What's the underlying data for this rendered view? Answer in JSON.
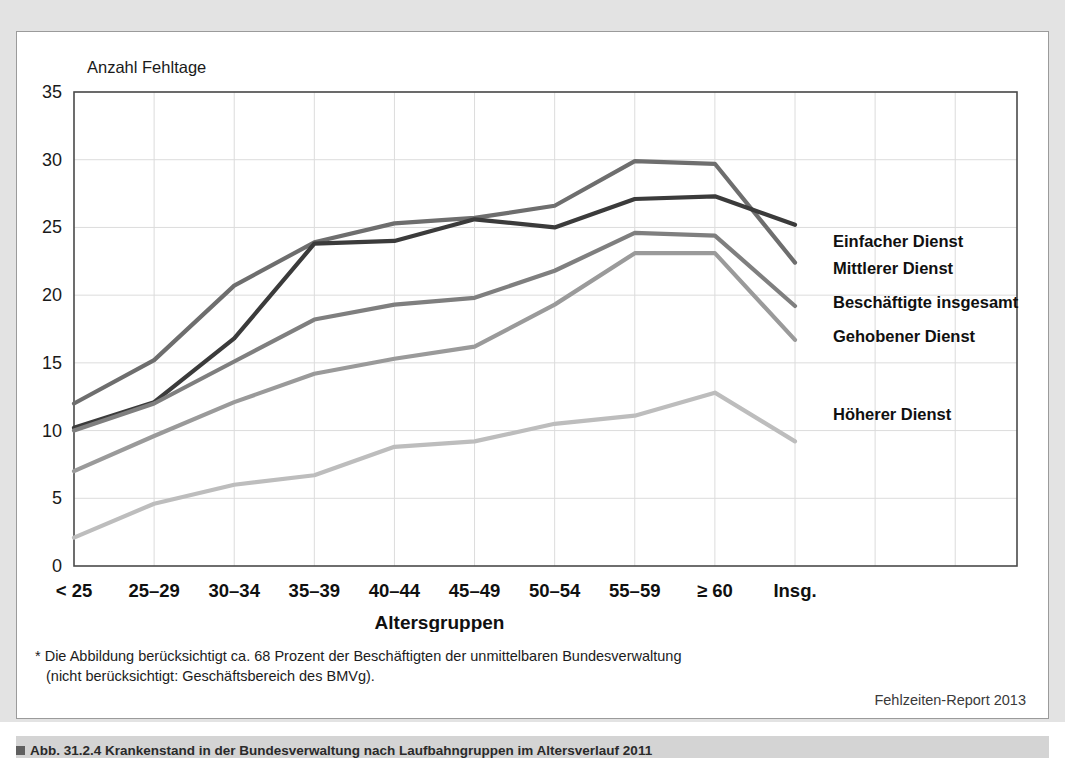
{
  "figure": {
    "y_axis_title": "Anzahl Fehltage",
    "x_axis_title": "Altersgruppen",
    "footnote_line1": "* Die Abbildung berücksichtigt ca. 68 Prozent der Beschäftigten der unmittelbaren Bundesverwaltung",
    "footnote_line2": "(nicht berücksichtigt: Geschäftsbereich des BMVg).",
    "source": "Fehlzeiten-Report 2013",
    "caption": "Abb. 31.2.4  Krankenstand in der Bundesverwaltung nach Laufbahngruppen im Altersverlauf 2011"
  },
  "chart_data": {
    "type": "line",
    "title": "",
    "xlabel": "Altersgruppen",
    "ylabel": "Anzahl Fehltage",
    "ylim": [
      0,
      35
    ],
    "yticks": [
      0,
      5,
      10,
      15,
      20,
      25,
      30,
      35
    ],
    "grid": true,
    "legend_position": "right-inline",
    "categories": [
      "< 25",
      "25–29",
      "30–34",
      "35–39",
      "40–44",
      "45–49",
      "50–54",
      "55–59",
      "≥ 60",
      "Insg."
    ],
    "series": [
      {
        "name": "Einfacher Dienst",
        "color": "#6e6e6e",
        "label_y_value": 24.0,
        "values": [
          12.0,
          15.2,
          20.7,
          23.9,
          25.3,
          25.7,
          26.6,
          29.9,
          29.7,
          22.4
        ]
      },
      {
        "name": "Mittlerer Dienst",
        "color": "#3b3b3b",
        "label_y_value": 22.0,
        "values": [
          10.2,
          12.1,
          16.8,
          23.8,
          24.0,
          25.6,
          25.0,
          27.1,
          27.3,
          25.2
        ]
      },
      {
        "name": "Beschäftigte insgesamt",
        "color": "#7f7f7f",
        "label_y_value": 19.5,
        "values": [
          10.0,
          12.0,
          15.1,
          18.2,
          19.3,
          19.8,
          21.8,
          24.6,
          24.4,
          19.2
        ]
      },
      {
        "name": "Gehobener Dienst",
        "color": "#9a9a9a",
        "label_y_value": 17.0,
        "values": [
          7.0,
          9.6,
          12.1,
          14.2,
          15.3,
          16.2,
          19.3,
          23.1,
          23.1,
          16.7
        ]
      },
      {
        "name": "Höherer Dienst",
        "color": "#bdbdbd",
        "label_y_value": 11.2,
        "values": [
          2.1,
          4.6,
          6.0,
          6.7,
          8.8,
          9.2,
          10.5,
          11.1,
          12.8,
          9.2
        ]
      }
    ]
  }
}
